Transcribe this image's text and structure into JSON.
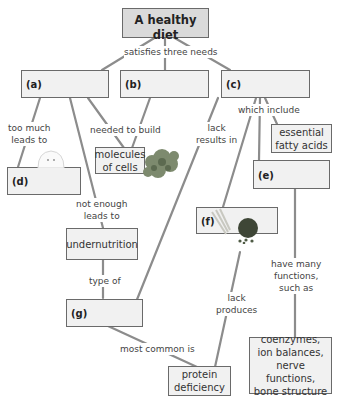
{
  "title_node": {
    "line1": "A healthy",
    "line2": "diet"
  },
  "nodes": {
    "a": {
      "label": "(a)"
    },
    "b": {
      "label": "(b)"
    },
    "c": {
      "label": "(c)"
    },
    "d": {
      "label": "(d)"
    },
    "e": {
      "label": "(e)"
    },
    "f": {
      "label": "(f)"
    },
    "g": {
      "label": "(g)"
    },
    "molecules": {
      "line1": "molecules",
      "line2": "of cells"
    },
    "fatty_acids": {
      "line1": "essential",
      "line2": "fatty acids"
    },
    "undernutrition": {
      "text": "undernutrition"
    },
    "protein_deficiency": {
      "line1": "protein",
      "line2": "deficiency"
    },
    "functions": {
      "line1": "coenzymes,",
      "line2": "ion balances,",
      "line3": "nerve functions,",
      "line4": "bone structure"
    }
  },
  "links": {
    "satisfies": "satisfies three needs",
    "too_much_1": "too much",
    "too_much_2": "leads to",
    "needed": "needed to build",
    "not_enough_1": "not enough",
    "not_enough_2": "leads to",
    "lack_results_1": "lack",
    "lack_results_2": "results in",
    "which_include": "which include",
    "type_of": "type of",
    "most_common": "most common is",
    "lack_produces_1": "lack",
    "lack_produces_2": "produces",
    "have_many_1": "have many",
    "have_many_2": "functions,",
    "have_many_3": "such as"
  },
  "images": {
    "mouse": "obese-mouse-image",
    "protein": "protein-molecule-image",
    "seeds": "grains-and-seeds-image"
  },
  "colors": {
    "title_fill": "#dadada",
    "box_fill": "#f1f1f1",
    "border": "#6a6a6a",
    "connector": "#8c8c8c"
  }
}
